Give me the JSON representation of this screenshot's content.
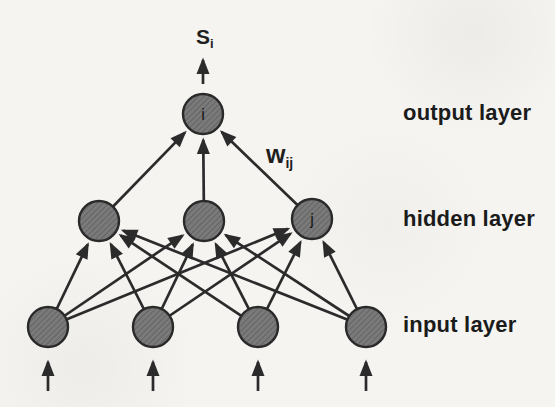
{
  "colors": {
    "background": "#f5f4f1",
    "node_fill": "#7a7a7a",
    "node_hatch": "#5c5c5c",
    "node_stroke": "#2a2a2a",
    "line": "#2b2b2b",
    "text": "#1b1b1b",
    "node_letter": "#161616"
  },
  "network": {
    "signal_label": {
      "base": "S",
      "sub": "i",
      "x": 196,
      "y": 26
    },
    "weight_label": {
      "base": "w",
      "sub": "ij",
      "x": 266,
      "y": 142
    },
    "layers": [
      {
        "id": "output",
        "caption": "output layer",
        "caption_x": 403,
        "caption_y": 113,
        "r": 20,
        "nodes": [
          {
            "x": 203,
            "y": 114,
            "letter": "i"
          }
        ]
      },
      {
        "id": "hidden",
        "caption": "hidden layer",
        "caption_x": 403,
        "caption_y": 219,
        "r": 20,
        "nodes": [
          {
            "x": 99,
            "y": 221
          },
          {
            "x": 204,
            "y": 221
          },
          {
            "x": 312,
            "y": 219,
            "letter": "j"
          }
        ]
      },
      {
        "id": "input",
        "caption": "input layer",
        "caption_x": 403,
        "caption_y": 325,
        "r": 20,
        "nodes": [
          {
            "x": 48,
            "y": 327
          },
          {
            "x": 153,
            "y": 327
          },
          {
            "x": 258,
            "y": 327
          },
          {
            "x": 366,
            "y": 327
          }
        ]
      }
    ],
    "connections": [
      {
        "from": 2,
        "to": 1
      },
      {
        "from": 1,
        "to": 0
      }
    ],
    "has_input_feed_arrows": true,
    "has_output_feed_arrow": true
  }
}
